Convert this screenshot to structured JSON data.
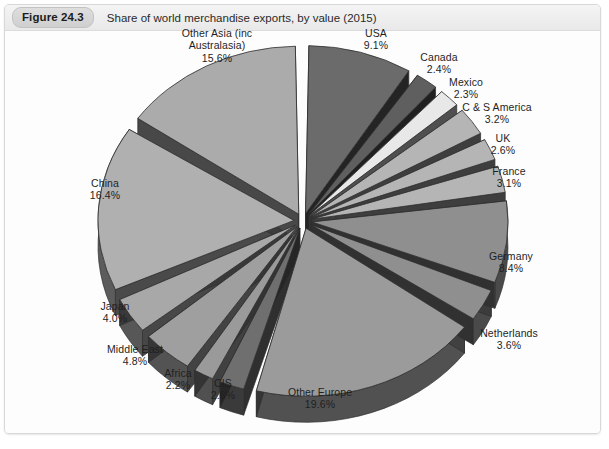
{
  "header": {
    "badge": "Figure 24.3",
    "title": "Share of world merchandise exports, by value (2015)"
  },
  "source_caption": "",
  "colors": {
    "dark_gray": "#6b6b6b",
    "mid_gray": "#8f8f8f",
    "light_gray": "#b5b5b5",
    "pale_gray": "#d2d2d2",
    "near_white": "#e8e8e8",
    "side_shadow": "#3a3a3a",
    "card_border": "#d8d8d8",
    "header_bg": "#efefef"
  },
  "chart_data": {
    "type": "pie",
    "title": "Share of world merchandise exports, by value (2015)",
    "unit": "percent",
    "exploded": true,
    "three_d": true,
    "start_angle_deg": 0,
    "direction": "clockwise",
    "legend": "none",
    "labels_position": "outside",
    "categories": [
      "USA",
      "Canada",
      "Mexico",
      "C & S America",
      "UK",
      "France",
      "Germany",
      "Netherlands",
      "Other Europe",
      "CIS",
      "Africa",
      "Middle East",
      "Japan",
      "China",
      "Other Asia (inc Australasia)"
    ],
    "values": [
      9.1,
      2.4,
      2.3,
      3.2,
      2.6,
      3.1,
      8.4,
      3.6,
      19.6,
      2.6,
      2.2,
      4.8,
      4.0,
      16.4,
      15.6
    ],
    "slices": [
      {
        "name": "USA",
        "label": "USA",
        "value": 9.1,
        "value_text": "9.1%",
        "color": "#6b6b6b"
      },
      {
        "name": "Canada",
        "label": "Canada",
        "value": 2.4,
        "value_text": "2.4%",
        "color": "#5f5f5f"
      },
      {
        "name": "Mexico",
        "label": "Mexico",
        "value": 2.3,
        "value_text": "2.3%",
        "color": "#e8e8e8"
      },
      {
        "name": "C & S America",
        "label": "C & S America",
        "value": 3.2,
        "value_text": "3.2%",
        "color": "#b5b5b5"
      },
      {
        "name": "UK",
        "label": "UK",
        "value": 2.6,
        "value_text": "2.6%",
        "color": "#b5b5b5"
      },
      {
        "name": "France",
        "label": "France",
        "value": 3.1,
        "value_text": "3.1%",
        "color": "#b5b5b5"
      },
      {
        "name": "Germany",
        "label": "Germany",
        "value": 8.4,
        "value_text": "8.4%",
        "color": "#8f8f8f"
      },
      {
        "name": "Netherlands",
        "label": "Netherlands",
        "value": 3.6,
        "value_text": "3.6%",
        "color": "#8f8f8f"
      },
      {
        "name": "Other Europe",
        "label": "Other Europe",
        "value": 19.6,
        "value_text": "19.6%",
        "color": "#9b9b9b"
      },
      {
        "name": "CIS",
        "label": "CIS",
        "value": 2.6,
        "value_text": "2.6%",
        "color": "#6f6f6f"
      },
      {
        "name": "Africa",
        "label": "Africa",
        "value": 2.2,
        "value_text": "2.2%",
        "color": "#9a9a9a"
      },
      {
        "name": "Middle East",
        "label": "Middle East",
        "value": 4.8,
        "value_text": "4.8%",
        "color": "#9f9f9f"
      },
      {
        "name": "Japan",
        "label": "Japan",
        "value": 4.0,
        "value_text": "4.0%",
        "color": "#a8a8a8"
      },
      {
        "name": "China",
        "label": "China",
        "value": 16.4,
        "value_text": "16.4%",
        "color": "#b0b0b0"
      },
      {
        "name": "Other Asia (inc Australasia)",
        "label": "Other Asia (inc\nAustralasia)",
        "value": 15.6,
        "value_text": "15.6%",
        "color": "#ababab"
      }
    ]
  },
  "labels": [
    {
      "name": "label-other-asia",
      "text": "Other Asia (inc\nAustralasia)",
      "value_text": "15.6%",
      "x": 156,
      "y": 22,
      "w": 112
    },
    {
      "name": "label-usa",
      "text": "USA",
      "value_text": "9.1%",
      "x": 343,
      "y": 22,
      "w": 56
    },
    {
      "name": "label-canada",
      "text": "Canada",
      "value_text": "2.4%",
      "x": 403,
      "y": 46,
      "w": 62
    },
    {
      "name": "label-mexico",
      "text": "Mexico",
      "value_text": "2.3%",
      "x": 430,
      "y": 71,
      "w": 62
    },
    {
      "name": "label-c-s-america",
      "text": "C & S America",
      "value_text": "3.2%",
      "x": 440,
      "y": 96,
      "w": 104
    },
    {
      "name": "label-uk",
      "text": "UK",
      "value_text": "2.6%",
      "x": 474,
      "y": 127,
      "w": 48
    },
    {
      "name": "label-france",
      "text": "France",
      "value_text": "3.1%",
      "x": 474,
      "y": 160,
      "w": 60
    },
    {
      "name": "label-germany",
      "text": "Germany",
      "value_text": "8.4%",
      "x": 468,
      "y": 245,
      "w": 76
    },
    {
      "name": "label-netherlands",
      "text": "Netherlands",
      "value_text": "3.6%",
      "x": 458,
      "y": 322,
      "w": 92
    },
    {
      "name": "label-other-europe",
      "text": "Other Europe",
      "value_text": "19.6%",
      "x": 266,
      "y": 381,
      "w": 98
    },
    {
      "name": "label-cis",
      "text": "CIS",
      "value_text": "2.6%",
      "x": 198,
      "y": 372,
      "w": 40
    },
    {
      "name": "label-africa",
      "text": "Africa",
      "value_text": "2.2%",
      "x": 148,
      "y": 362,
      "w": 50
    },
    {
      "name": "label-middle-east",
      "text": "Middle East",
      "value_text": "4.8%",
      "x": 86,
      "y": 338,
      "w": 88
    },
    {
      "name": "label-japan",
      "text": "Japan",
      "value_text": "4.0%",
      "x": 82,
      "y": 295,
      "w": 56
    },
    {
      "name": "label-china",
      "text": "China",
      "value_text": "16.4%",
      "x": 72,
      "y": 172,
      "w": 56
    }
  ]
}
